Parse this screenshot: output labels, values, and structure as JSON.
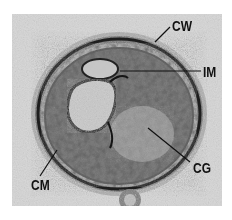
{
  "figure": {
    "type": "transmission electron micrograph",
    "labels": [
      {
        "id": "cw",
        "text": "CW"
      },
      {
        "id": "im",
        "text": "IM"
      },
      {
        "id": "cg",
        "text": "CG"
      },
      {
        "id": "cm",
        "text": "CM"
      }
    ]
  },
  "colors": {
    "background": "#ffffff",
    "photo_background": "#d9d9d9",
    "cell_dark": "#2a2a2a",
    "label_text": "#111111"
  }
}
